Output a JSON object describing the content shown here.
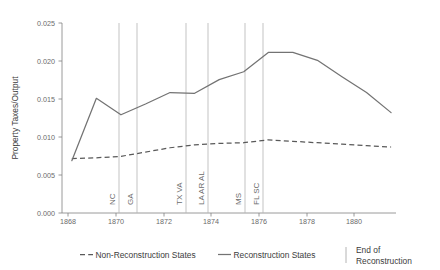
{
  "chart_data": {
    "type": "line",
    "title": "",
    "xlabel": "",
    "ylabel": "Property Taxes/Output",
    "xlim": [
      1867.6,
      1881.2
    ],
    "ylim": [
      0.0,
      0.0265
    ],
    "grid": false,
    "legend_position": "bottom",
    "x_ticks": [
      "1868",
      "1870",
      "1872",
      "1874",
      "1876",
      "1878",
      "1880"
    ],
    "x_tick_values": [
      1868,
      1870,
      1872,
      1874,
      1876,
      1878,
      1880
    ],
    "y_ticks": [
      "0.000",
      "0.005",
      "0.010",
      "0.015",
      "0.020",
      "0.025"
    ],
    "y_tick_values": [
      0.0,
      0.005,
      0.01,
      0.015,
      0.02,
      0.025
    ],
    "x": [
      1868,
      1869,
      1870,
      1871,
      1872,
      1873,
      1874,
      1875,
      1876,
      1877,
      1878,
      1879,
      1880,
      1881
    ],
    "series": [
      {
        "name": "Reconstruction States",
        "style": "solid",
        "color": "#737373",
        "values": [
          0.0073,
          0.016,
          0.0137,
          0.0152,
          0.0168,
          0.0167,
          0.0186,
          0.0197,
          0.0224,
          0.0224,
          0.0213,
          0.019,
          0.0168,
          0.014
        ]
      },
      {
        "name": "Non-Reconstruction States",
        "style": "dashed",
        "color": "#595959",
        "values": [
          0.0076,
          0.0077,
          0.0079,
          0.0085,
          0.0091,
          0.0095,
          0.0097,
          0.0098,
          0.0102,
          0.01,
          0.0098,
          0.0096,
          0.0094,
          0.0092
        ]
      }
    ],
    "event_lines": [
      {
        "label": "NC",
        "year": 1870.05,
        "states": [
          "NC"
        ]
      },
      {
        "label": "GA",
        "year": 1870.82,
        "states": [
          "GA"
        ]
      },
      {
        "label": "TX  VA",
        "year": 1872.9,
        "states": [
          "TX",
          "VA"
        ]
      },
      {
        "label": "LA  AR  AL",
        "year": 1873.8,
        "states": [
          "LA",
          "AR",
          "AL"
        ]
      },
      {
        "label": "MS",
        "year": 1875.35,
        "states": [
          "MS"
        ]
      },
      {
        "label": "FL  SC",
        "year": 1876.1,
        "states": [
          "FL",
          "SC"
        ]
      }
    ],
    "event_line_color": "#b4b4b4",
    "annotations": []
  },
  "axes": {
    "y_title": "Property Taxes/Output"
  },
  "legend": {
    "items": [
      {
        "key": "dashed",
        "label": "Non-Reconstruction States"
      },
      {
        "key": "solid",
        "label": "Reconstruction States"
      },
      {
        "key": "vline",
        "label_line1": "End of",
        "label_line2": "Reconstruction"
      }
    ]
  },
  "colors": {
    "line": "#737373",
    "dash": "#595959",
    "vline": "#b4b4b4",
    "axis": "#808080",
    "text": "#4d4d4d"
  }
}
